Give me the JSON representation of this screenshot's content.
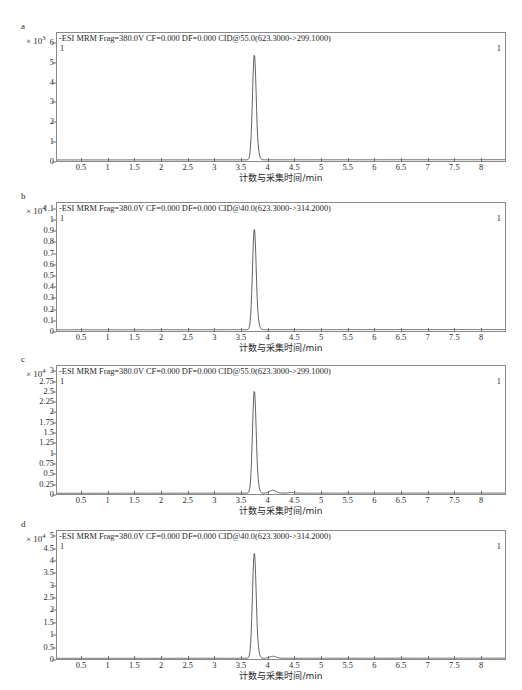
{
  "figure": {
    "axis_title": "计数与采集时间/min",
    "trace_marker": "1",
    "xticks": [
      "0.5",
      "1",
      "1.5",
      "2",
      "2.5",
      "3",
      "3.5",
      "4",
      "4.5",
      "5",
      "5.5",
      "6",
      "6.5",
      "7",
      "7.5",
      "8"
    ],
    "xlim": [
      0.05,
      8.45
    ],
    "line_color": "#3a3a3a"
  },
  "chart_data": [
    {
      "type": "line",
      "panel": "a",
      "title": "-ESI MRM Frag=380.0V CF=0.000 DF=0.000 CID@55.0(623.3000->299.1000)",
      "exponent_label": "× 10",
      "exponent": "3",
      "ylabel": "",
      "xlabel": "计数与采集时间/min",
      "ylim": [
        0,
        6.55
      ],
      "xlim": [
        0.05,
        8.45
      ],
      "yticks": [
        "0",
        "1",
        "2",
        "3",
        "4",
        "5",
        "6"
      ],
      "ytick_values": [
        0,
        1,
        2,
        3,
        4,
        5,
        6
      ],
      "grid": false,
      "legend": "1",
      "peaks": [
        {
          "retention_time": 3.75,
          "height": 6.0,
          "width": 0.07,
          "label": "1"
        }
      ],
      "baseline": 0.06,
      "x": [
        0.05,
        0.5,
        1.0,
        1.5,
        2.0,
        2.5,
        3.0,
        3.4,
        3.6,
        3.68,
        3.72,
        3.75,
        3.79,
        3.83,
        3.9,
        4.0,
        4.2,
        4.6,
        5.0,
        5.5,
        6.0,
        6.5,
        7.0,
        7.5,
        8.0,
        8.45
      ],
      "y": [
        0.06,
        0.06,
        0.07,
        0.06,
        0.07,
        0.06,
        0.07,
        0.07,
        0.09,
        0.6,
        3.6,
        6.0,
        3.2,
        0.9,
        0.25,
        0.12,
        0.09,
        0.08,
        0.08,
        0.08,
        0.08,
        0.09,
        0.09,
        0.1,
        0.1,
        0.1
      ]
    },
    {
      "type": "line",
      "panel": "b",
      "title": "-ESI MRM Frag=380.0V CF=0.000 DF=0.000 CID@40.0(623.3000->314.2000)",
      "exponent_label": "× 10",
      "exponent": "4",
      "ylabel": "",
      "xlabel": "计数与采集时间/min",
      "ylim": [
        0,
        1.16
      ],
      "xlim": [
        0.05,
        8.45
      ],
      "yticks": [
        "0",
        "0.1",
        "0.2",
        "0.3",
        "0.4",
        "0.5",
        "0.6",
        "0.7",
        "0.8",
        "0.9",
        "1",
        "1.1"
      ],
      "ytick_values": [
        0,
        0.1,
        0.2,
        0.3,
        0.4,
        0.5,
        0.6,
        0.7,
        0.8,
        0.9,
        1,
        1.1
      ],
      "grid": false,
      "legend": "1",
      "peaks": [
        {
          "retention_time": 3.75,
          "height": 1.02,
          "width": 0.07,
          "label": "1"
        }
      ],
      "baseline": 0.012,
      "x": [
        0.05,
        0.5,
        1.0,
        1.5,
        2.0,
        2.5,
        3.0,
        3.4,
        3.6,
        3.68,
        3.72,
        3.75,
        3.79,
        3.83,
        3.9,
        4.0,
        4.2,
        4.6,
        5.0,
        5.5,
        6.0,
        6.5,
        7.0,
        7.5,
        8.0,
        8.45
      ],
      "y": [
        0.012,
        0.012,
        0.013,
        0.012,
        0.013,
        0.012,
        0.013,
        0.013,
        0.018,
        0.1,
        0.62,
        1.02,
        0.55,
        0.16,
        0.05,
        0.02,
        0.015,
        0.014,
        0.014,
        0.014,
        0.014,
        0.015,
        0.015,
        0.016,
        0.016,
        0.016
      ]
    },
    {
      "type": "line",
      "panel": "c",
      "title": "-ESI MRM Frag=380.0V CF=0.000 DF=0.000 CID@55.0(623.3000->299.1000)",
      "exponent_label": "× 10",
      "exponent": "4",
      "ylabel": "",
      "xlabel": "计数与采集时间/min",
      "ylim": [
        0,
        3.15
      ],
      "xlim": [
        0.05,
        8.45
      ],
      "yticks": [
        "0",
        "0.25",
        "0.5",
        "0.75",
        "1",
        "1.25",
        "1.5",
        "1.75",
        "2",
        "2.25",
        "2.5",
        "2.75",
        "3"
      ],
      "ytick_values": [
        0,
        0.25,
        0.5,
        0.75,
        1,
        1.25,
        1.5,
        1.75,
        2,
        2.25,
        2.5,
        2.75,
        3
      ],
      "grid": false,
      "legend": "1",
      "peaks": [
        {
          "retention_time": 3.75,
          "height": 2.8,
          "width": 0.07,
          "label": "1"
        },
        {
          "retention_time": 4.1,
          "height": 0.1,
          "width": 0.12,
          "label": ""
        },
        {
          "retention_time": 4.45,
          "height": 0.04,
          "width": 0.1,
          "label": ""
        }
      ],
      "baseline": 0.02,
      "x": [
        0.05,
        0.5,
        1.0,
        1.5,
        2.0,
        2.5,
        3.0,
        3.4,
        3.6,
        3.68,
        3.72,
        3.75,
        3.79,
        3.83,
        3.9,
        4.0,
        4.1,
        4.2,
        4.35,
        4.45,
        4.6,
        5.0,
        5.5,
        6.0,
        6.5,
        7.0,
        7.5,
        8.0,
        8.45
      ],
      "y": [
        0.02,
        0.02,
        0.022,
        0.02,
        0.022,
        0.02,
        0.022,
        0.022,
        0.03,
        0.3,
        1.7,
        2.8,
        1.5,
        0.42,
        0.1,
        0.06,
        0.1,
        0.07,
        0.03,
        0.05,
        0.03,
        0.025,
        0.025,
        0.025,
        0.027,
        0.027,
        0.028,
        0.03,
        0.03
      ]
    },
    {
      "type": "line",
      "panel": "d",
      "title": "-ESI MRM Frag=380.0V CF=0.000 DF=0.000 CID@40.0(623.3000->314.2000)",
      "exponent_label": "× 10",
      "exponent": "4",
      "ylabel": "",
      "xlabel": "计数与采集时间/min",
      "ylim": [
        0,
        5.25
      ],
      "xlim": [
        0.05,
        8.45
      ],
      "yticks": [
        "0",
        "0.5",
        "1",
        "1.5",
        "2",
        "2.5",
        "3",
        "3.5",
        "4",
        "4.5",
        "5"
      ],
      "ytick_values": [
        0,
        0.5,
        1,
        1.5,
        2,
        2.5,
        3,
        3.5,
        4,
        4.5,
        5
      ],
      "grid": false,
      "legend": "1",
      "peaks": [
        {
          "retention_time": 3.75,
          "height": 4.8,
          "width": 0.07,
          "label": "1"
        },
        {
          "retention_time": 4.1,
          "height": 0.12,
          "width": 0.12,
          "label": ""
        }
      ],
      "baseline": 0.03,
      "x": [
        0.05,
        0.5,
        1.0,
        1.5,
        2.0,
        2.5,
        3.0,
        3.4,
        3.6,
        3.68,
        3.72,
        3.75,
        3.79,
        3.83,
        3.9,
        4.0,
        4.1,
        4.2,
        4.4,
        4.6,
        5.0,
        5.5,
        6.0,
        6.5,
        7.0,
        7.5,
        8.0,
        8.45
      ],
      "y": [
        0.03,
        0.03,
        0.035,
        0.03,
        0.035,
        0.03,
        0.035,
        0.035,
        0.05,
        0.5,
        2.9,
        4.8,
        2.6,
        0.7,
        0.18,
        0.09,
        0.12,
        0.08,
        0.05,
        0.045,
        0.04,
        0.04,
        0.04,
        0.045,
        0.045,
        0.05,
        0.05,
        0.05
      ]
    }
  ],
  "panels": [
    {
      "letter": "a"
    },
    {
      "letter": "b"
    },
    {
      "letter": "c"
    },
    {
      "letter": "d"
    }
  ]
}
